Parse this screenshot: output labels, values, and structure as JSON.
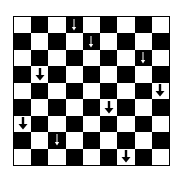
{
  "board": {
    "rows": 9,
    "cols": 9,
    "light_color": "#ffffff",
    "dark_color": "#000000",
    "first_cell": "light",
    "arrows": [
      {
        "row": 0,
        "col": 3,
        "direction": "down",
        "style": "thin",
        "color": "#ffffff"
      },
      {
        "row": 1,
        "col": 4,
        "direction": "down",
        "style": "thin",
        "color": "#ffffff"
      },
      {
        "row": 2,
        "col": 7,
        "direction": "down",
        "style": "thin",
        "color": "#ffffff"
      },
      {
        "row": 3,
        "col": 1,
        "direction": "down",
        "style": "thick",
        "color": "#000000"
      },
      {
        "row": 4,
        "col": 8,
        "direction": "down",
        "style": "thick",
        "color": "#000000"
      },
      {
        "row": 5,
        "col": 5,
        "direction": "down",
        "style": "thick",
        "color": "#000000"
      },
      {
        "row": 6,
        "col": 0,
        "direction": "down",
        "style": "thick",
        "color": "#000000"
      },
      {
        "row": 7,
        "col": 2,
        "direction": "down",
        "style": "thin",
        "color": "#ffffff"
      },
      {
        "row": 8,
        "col": 6,
        "direction": "down",
        "style": "thick",
        "color": "#000000"
      }
    ]
  }
}
